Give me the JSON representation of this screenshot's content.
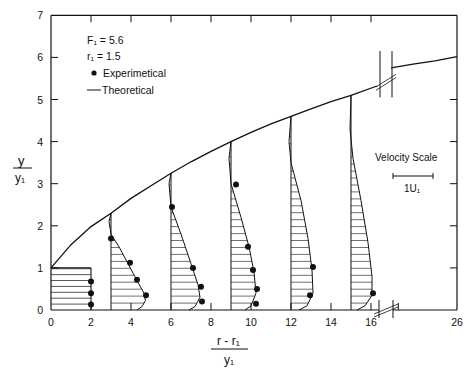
{
  "chart_data": {
    "type": "line",
    "title": "",
    "xlabel": {
      "numerator": "r - r₁",
      "denominator": "y₁"
    },
    "ylabel": {
      "numerator": "y",
      "denominator": "y₁"
    },
    "xlim": [
      0,
      26
    ],
    "ylim": [
      0,
      7
    ],
    "x_axis_break": [
      16.5,
      17
    ],
    "x_ticks": [
      0,
      2,
      4,
      6,
      8,
      10,
      12,
      14,
      16,
      26
    ],
    "x_tick_labels": [
      "0",
      "2",
      "4",
      "6",
      "8",
      "10",
      "12",
      "14",
      "16",
      "26"
    ],
    "y_ticks": [
      0,
      1,
      2,
      3,
      4,
      5,
      6,
      7
    ],
    "y_tick_labels": [
      "0",
      "1",
      "2",
      "3",
      "4",
      "5",
      "6",
      "7"
    ],
    "grid": false,
    "parameters": [
      {
        "label": "F₁ = 5.6"
      },
      {
        "label": "r₁ = 1.5"
      }
    ],
    "legend": {
      "placement": "top-left",
      "entries": [
        {
          "name": "Experimetical",
          "marker": "dot"
        },
        {
          "name": "Theoretical",
          "marker": "line"
        }
      ]
    },
    "velocity_scale": {
      "title": "Velocity Scale",
      "label": "1U₁",
      "length_units": 2
    },
    "boundary": {
      "name": "Theoretical layer boundary",
      "segment1": [
        [
          0,
          1.0
        ],
        [
          1,
          1.55
        ],
        [
          2,
          1.98
        ],
        [
          3,
          2.3
        ],
        [
          4,
          2.65
        ],
        [
          5,
          2.95
        ],
        [
          6,
          3.25
        ],
        [
          7,
          3.52
        ],
        [
          8,
          3.77
        ],
        [
          9,
          4.0
        ],
        [
          10,
          4.22
        ],
        [
          11,
          4.42
        ],
        [
          12,
          4.6
        ],
        [
          13,
          4.78
        ],
        [
          14,
          4.95
        ],
        [
          15,
          5.1
        ],
        [
          16.3,
          5.32
        ]
      ],
      "segment2": [
        [
          17.0,
          5.75
        ],
        [
          20,
          5.84
        ],
        [
          23,
          5.92
        ],
        [
          26,
          6.02
        ]
      ]
    },
    "profiles": [
      {
        "station": 0,
        "theoretical": [
          [
            2,
            0
          ],
          [
            2,
            1.0
          ]
        ],
        "top": 1.0,
        "experimental": [
          [
            2,
            0.13
          ],
          [
            2,
            0.4
          ],
          [
            2,
            0.68
          ]
        ]
      },
      {
        "station": 3,
        "top": 2.3,
        "theoretical": [
          [
            3,
            2.3
          ],
          [
            2.9,
            2.1
          ],
          [
            3.0,
            1.8
          ],
          [
            3.4,
            1.5
          ],
          [
            3.85,
            1.1
          ],
          [
            4.3,
            0.7
          ],
          [
            4.65,
            0.4
          ],
          [
            4.72,
            0.22
          ],
          [
            4.55,
            0.08
          ],
          [
            4.3,
            0.0
          ]
        ],
        "experimental": [
          [
            3.0,
            1.7
          ],
          [
            3.95,
            1.12
          ],
          [
            4.3,
            0.72
          ],
          [
            4.75,
            0.35
          ]
        ]
      },
      {
        "station": 6,
        "top": 3.25,
        "theoretical": [
          [
            6,
            3.25
          ],
          [
            5.9,
            3.0
          ],
          [
            6.0,
            2.45
          ],
          [
            6.5,
            1.8
          ],
          [
            7.0,
            1.1
          ],
          [
            7.35,
            0.6
          ],
          [
            7.45,
            0.3
          ],
          [
            7.2,
            0.08
          ],
          [
            6.9,
            0.0
          ]
        ],
        "experimental": [
          [
            6.05,
            2.45
          ],
          [
            7.1,
            1.0
          ],
          [
            7.5,
            0.55
          ],
          [
            7.55,
            0.2
          ]
        ]
      },
      {
        "station": 9,
        "top": 4.0,
        "theoretical": [
          [
            9,
            4.0
          ],
          [
            8.9,
            3.6
          ],
          [
            9.0,
            3.0
          ],
          [
            9.5,
            2.2
          ],
          [
            9.9,
            1.5
          ],
          [
            10.15,
            0.9
          ],
          [
            10.25,
            0.4
          ],
          [
            10.0,
            0.1
          ],
          [
            9.7,
            0.0
          ]
        ],
        "experimental": [
          [
            9.25,
            2.98
          ],
          [
            9.85,
            1.5
          ],
          [
            10.1,
            0.95
          ],
          [
            10.3,
            0.5
          ],
          [
            10.25,
            0.15
          ]
        ]
      },
      {
        "station": 12,
        "top": 4.6,
        "theoretical": [
          [
            12,
            4.6
          ],
          [
            11.9,
            4.0
          ],
          [
            12.0,
            3.5
          ],
          [
            12.5,
            2.6
          ],
          [
            12.85,
            1.7
          ],
          [
            13.05,
            0.95
          ],
          [
            13.1,
            0.4
          ],
          [
            12.8,
            0.1
          ],
          [
            12.4,
            0.0
          ]
        ],
        "experimental": [
          [
            13.1,
            1.02
          ],
          [
            12.95,
            0.35
          ]
        ]
      },
      {
        "station": 15,
        "top": 5.1,
        "theoretical": [
          [
            15,
            5.1
          ],
          [
            14.95,
            4.3
          ],
          [
            15.1,
            3.6
          ],
          [
            15.5,
            2.6
          ],
          [
            15.85,
            1.6
          ],
          [
            16.05,
            0.8
          ],
          [
            16.05,
            0.35
          ],
          [
            15.7,
            0.1
          ],
          [
            15.3,
            0.0
          ]
        ],
        "experimental": [
          [
            16.1,
            0.4
          ]
        ]
      }
    ]
  }
}
